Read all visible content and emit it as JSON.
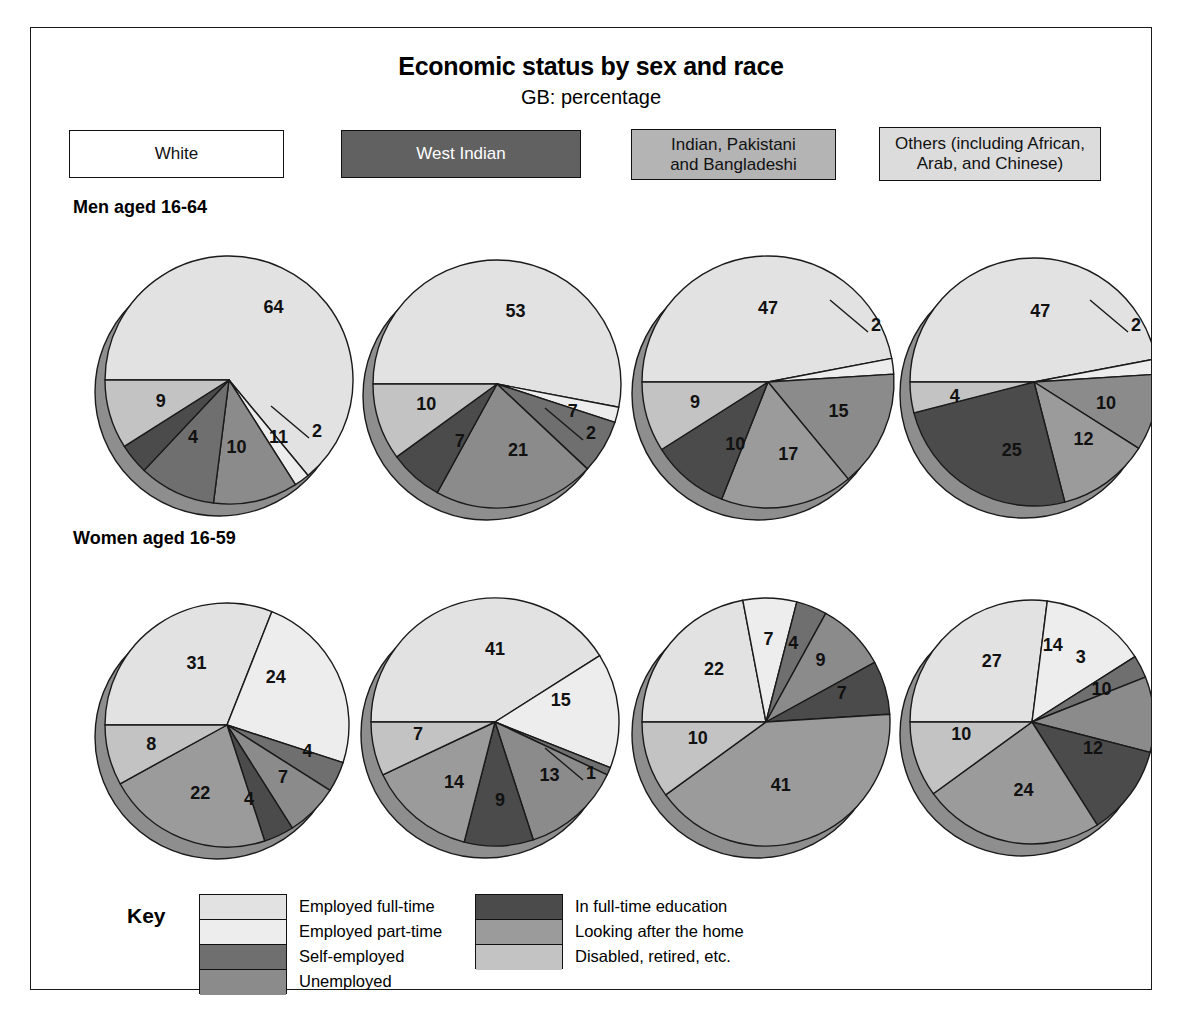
{
  "title": "Economic status by sex and race",
  "subtitle": "GB: percentage",
  "groups": [
    {
      "label": "White",
      "color": "#ffffff",
      "text": "#111111"
    },
    {
      "label": "West Indian",
      "color": "#616161",
      "text": "#ffffff"
    },
    {
      "label": "Indian, Pakistani\nand Bangladeshi",
      "color": "#b4b4b4",
      "text": "#111111"
    },
    {
      "label": "Others (including African,\nArab, and Chinese)",
      "color": "#dcdcdc",
      "text": "#111111"
    }
  ],
  "rows": [
    {
      "label": "Men aged 16-64"
    },
    {
      "label": "Women aged 16-59"
    }
  ],
  "key": {
    "word": "Key",
    "left": [
      {
        "label": "Employed full-time",
        "color": "#e2e2e2"
      },
      {
        "label": "Employed part-time",
        "color": "#ededed"
      },
      {
        "label": "Self-employed",
        "color": "#6f6f6f"
      },
      {
        "label": "Unemployed",
        "color": "#8b8b8b"
      }
    ],
    "right": [
      {
        "label": "In full-time education",
        "color": "#4b4b4b"
      },
      {
        "label": "Looking after the home",
        "color": "#9b9b9b"
      },
      {
        "label": "Disabled, retired, etc.",
        "color": "#c3c3c3"
      }
    ]
  },
  "chart_data": {
    "type": "pie",
    "title": "Economic status by sex and race",
    "subtitle": "GB: percentage",
    "unit": "percentage",
    "region": "GB",
    "categories": [
      "Employed full-time",
      "Employed part-time",
      "Self-employed",
      "Unemployed",
      "In full-time education",
      "Looking after the home",
      "Disabled, retired, etc."
    ],
    "category_colors": [
      "#e2e2e2",
      "#ededed",
      "#6f6f6f",
      "#8b8b8b",
      "#4b4b4b",
      "#9b9b9b",
      "#c3c3c3"
    ],
    "rows": [
      "Men aged 16-64",
      "Women aged 16-59"
    ],
    "columns": [
      "White",
      "West Indian",
      "Indian, Pakistani and Banyladeshi",
      "Others (including African, Arab, and Chinese)"
    ],
    "pies": [
      {
        "row": "Men aged 16-64",
        "column": "White",
        "cx": 198,
        "cy": 352,
        "r": 124,
        "start_angle": 180,
        "slices": [
          {
            "category": "Employed full-time",
            "value": 64,
            "color": "#e2e2e2",
            "label": "64",
            "lx": 0.36,
            "ly": -0.58
          },
          {
            "category": "Employed part-time",
            "value": 2,
            "color": "#ededed",
            "label": "2",
            "leader": true,
            "leader_dx": 76,
            "leader_dy": 52
          },
          {
            "category": "Unemployed",
            "value": 11,
            "color": "#8b8b8b",
            "label": "11",
            "lx": 0.4,
            "ly": 0.47
          },
          {
            "category": "Self-employed",
            "value": 10,
            "color": "#6f6f6f",
            "label": "10",
            "lx": 0.06,
            "ly": 0.55
          },
          {
            "category": "In full-time education",
            "value": 4,
            "color": "#4b4b4b",
            "label": "4",
            "lx": -0.29,
            "ly": 0.47
          },
          {
            "category": "Disabled, retired, etc.",
            "value": 9,
            "color": "#c3c3c3",
            "label": "9",
            "lx": -0.55,
            "ly": 0.18
          }
        ]
      },
      {
        "row": "Men aged 16-64",
        "column": "West Indian",
        "cx": 466,
        "cy": 356,
        "r": 124,
        "start_angle": 180,
        "slices": [
          {
            "category": "Employed full-time",
            "value": 53,
            "color": "#e2e2e2",
            "label": "53",
            "lx": 0.15,
            "ly": -0.58
          },
          {
            "category": "Employed part-time",
            "value": 2,
            "color": "#ededed",
            "label": "2",
            "leader": true,
            "leader_dx": 82,
            "leader_dy": 50
          },
          {
            "category": "Self-employed",
            "value": 7,
            "color": "#6f6f6f",
            "label": "7",
            "lx": 0.61,
            "ly": 0.23
          },
          {
            "category": "Unemployed",
            "value": 21,
            "color": "#8b8b8b",
            "label": "21",
            "lx": 0.17,
            "ly": 0.54
          },
          {
            "category": "In full-time education",
            "value": 7,
            "color": "#4b4b4b",
            "label": "7",
            "lx": -0.3,
            "ly": 0.47
          },
          {
            "category": "Disabled, retired, etc.",
            "value": 10,
            "color": "#c3c3c3",
            "label": "10",
            "lx": -0.57,
            "ly": 0.17
          }
        ]
      },
      {
        "row": "Men aged 16-64",
        "column": "Indian, Pakistani and Banyladeshi",
        "cx": 737,
        "cy": 354,
        "r": 126,
        "start_angle": 180,
        "slices": [
          {
            "category": "Employed full-time",
            "value": 47,
            "color": "#e2e2e2",
            "label": "47",
            "lx": 0.0,
            "ly": -0.58
          },
          {
            "category": "Employed part-time",
            "value": 2,
            "color": "#ededed",
            "label": "2",
            "leader": true,
            "leader_dx": 96,
            "leader_dy": -56
          },
          {
            "category": "Unemployed",
            "value": 15,
            "color": "#8b8b8b",
            "label": "15",
            "lx": 0.56,
            "ly": 0.24
          },
          {
            "category": "Looking after the home",
            "value": 17,
            "color": "#9b9b9b",
            "label": "17",
            "lx": 0.16,
            "ly": 0.58
          },
          {
            "category": "In full-time education",
            "value": 10,
            "color": "#4b4b4b",
            "label": "10",
            "lx": -0.26,
            "ly": 0.5
          },
          {
            "category": "Disabled, retired, etc.",
            "value": 9,
            "color": "#c3c3c3",
            "label": "9",
            "lx": -0.58,
            "ly": 0.17
          }
        ]
      },
      {
        "row": "Men aged 16-64",
        "column": "Others (including African, Arab, and Chinese)",
        "cx": 1003,
        "cy": 354,
        "r": 124,
        "start_angle": 180,
        "slices": [
          {
            "category": "Employed full-time",
            "value": 47,
            "color": "#e2e2e2",
            "label": "47",
            "lx": 0.05,
            "ly": -0.56
          },
          {
            "category": "Employed part-time",
            "value": 2,
            "color": "#ededed",
            "label": "2",
            "leader": true,
            "leader_dx": 90,
            "leader_dy": -56
          },
          {
            "category": "Unemployed",
            "value": 10,
            "color": "#8b8b8b",
            "label": "10",
            "lx": 0.58,
            "ly": 0.18
          },
          {
            "category": "Looking after the home",
            "value": 12,
            "color": "#9b9b9b",
            "label": "12",
            "lx": 0.4,
            "ly": 0.47
          },
          {
            "category": "In full-time education",
            "value": 25,
            "color": "#4b4b4b",
            "label": "25",
            "lx": -0.18,
            "ly": 0.56
          },
          {
            "category": "Disabled, retired, etc.",
            "value": 4,
            "color": "#c3c3c3",
            "label": "4",
            "lx": -0.64,
            "ly": 0.12
          }
        ]
      },
      {
        "row": "Women aged 16-59",
        "column": "White",
        "cx": 196,
        "cy": 697,
        "r": 122,
        "start_angle": 180,
        "slices": [
          {
            "category": "Employed full-time",
            "value": 31,
            "color": "#e2e2e2",
            "label": "31",
            "lx": -0.25,
            "ly": -0.5
          },
          {
            "category": "Employed part-time",
            "value": 24,
            "color": "#ededed",
            "label": "24",
            "lx": 0.4,
            "ly": -0.38
          },
          {
            "category": "Self-employed",
            "value": 4,
            "color": "#6f6f6f",
            "label": "4",
            "lx": 0.66,
            "ly": 0.22
          },
          {
            "category": "Unemployed",
            "value": 7,
            "color": "#8b8b8b",
            "label": "7",
            "lx": 0.46,
            "ly": 0.44
          },
          {
            "category": "In full-time education",
            "value": 4,
            "color": "#4b4b4b",
            "label": "4",
            "lx": 0.18,
            "ly": 0.62
          },
          {
            "category": "Looking after the home",
            "value": 22,
            "color": "#9b9b9b",
            "label": "22",
            "lx": -0.22,
            "ly": 0.57
          },
          {
            "category": "Disabled, retired, etc.",
            "value": 8,
            "color": "#c3c3c3",
            "label": "8",
            "lx": -0.62,
            "ly": 0.17
          }
        ]
      },
      {
        "row": "Women aged 16-59",
        "column": "West Indian",
        "cx": 464,
        "cy": 694,
        "r": 124,
        "start_angle": 180,
        "slices": [
          {
            "category": "Employed full-time",
            "value": 41,
            "color": "#e2e2e2",
            "label": "41",
            "lx": 0.0,
            "ly": -0.58
          },
          {
            "category": "Employed part-time",
            "value": 15,
            "color": "#ededed",
            "label": "15",
            "lx": 0.53,
            "ly": -0.17
          },
          {
            "category": "Self-employed",
            "value": 1,
            "color": "#6f6f6f",
            "label": "1",
            "leader": true,
            "leader_dx": 84,
            "leader_dy": 52
          },
          {
            "category": "Unemployed",
            "value": 13,
            "color": "#8b8b8b",
            "label": "13",
            "lx": 0.44,
            "ly": 0.44
          },
          {
            "category": "In full-time education",
            "value": 9,
            "color": "#4b4b4b",
            "label": "9",
            "lx": 0.04,
            "ly": 0.64
          },
          {
            "category": "Looking after the home",
            "value": 14,
            "color": "#9b9b9b",
            "label": "14",
            "lx": -0.33,
            "ly": 0.49
          },
          {
            "category": "Disabled, retired, etc.",
            "value": 7,
            "color": "#c3c3c3",
            "label": "7",
            "lx": -0.62,
            "ly": 0.11
          }
        ]
      },
      {
        "row": "Women aged 16-59",
        "column": "Indian, Pakistani and Banyladeshi",
        "cx": 735,
        "cy": 694,
        "r": 124,
        "start_angle": 180,
        "slices": [
          {
            "category": "Employed full-time",
            "value": 22,
            "color": "#e2e2e2",
            "label": "22",
            "lx": -0.42,
            "ly": -0.42
          },
          {
            "category": "Employed part-time",
            "value": 7,
            "color": "#ededed",
            "label": "7",
            "lx": 0.02,
            "ly": -0.66
          },
          {
            "category": "Self-employed",
            "value": 4,
            "color": "#6f6f6f",
            "label": "4",
            "lx": 0.22,
            "ly": -0.63
          },
          {
            "category": "Unemployed",
            "value": 9,
            "color": "#8b8b8b",
            "label": "9",
            "lx": 0.44,
            "ly": -0.49
          },
          {
            "category": "In full-time education",
            "value": 7,
            "color": "#4b4b4b",
            "label": "7",
            "lx": 0.61,
            "ly": -0.22
          },
          {
            "category": "Looking after the home",
            "value": 41,
            "color": "#9b9b9b",
            "label": "41",
            "lx": 0.12,
            "ly": 0.52
          },
          {
            "category": "Disabled, retired, etc.",
            "value": 10,
            "color": "#c3c3c3",
            "label": "10",
            "lx": -0.55,
            "ly": 0.14
          }
        ]
      },
      {
        "row": "Women aged 16-59",
        "column": "Others (including African, Arab, and Chinese)",
        "cx": 1001,
        "cy": 694,
        "r": 122,
        "start_angle": 180,
        "slices": [
          {
            "category": "Employed full-time",
            "value": 27,
            "color": "#e2e2e2",
            "label": "27",
            "lx": -0.33,
            "ly": -0.49
          },
          {
            "category": "Employed part-time",
            "value": 14,
            "color": "#ededed",
            "label": "14",
            "lx": 0.17,
            "ly": -0.62
          },
          {
            "category": "Self-employed",
            "value": 3,
            "color": "#6f6f6f",
            "label": "3",
            "lx": 0.4,
            "ly": -0.52
          },
          {
            "category": "Unemployed",
            "value": 10,
            "color": "#8b8b8b",
            "label": "10",
            "lx": 0.57,
            "ly": -0.26
          },
          {
            "category": "In full-time education",
            "value": 12,
            "color": "#4b4b4b",
            "label": "12",
            "lx": 0.5,
            "ly": 0.22
          },
          {
            "category": "Looking after the home",
            "value": 24,
            "color": "#9b9b9b",
            "label": "24",
            "lx": -0.07,
            "ly": 0.57
          },
          {
            "category": "Disabled, retired, etc.",
            "value": 10,
            "color": "#c3c3c3",
            "label": "10",
            "lx": -0.58,
            "ly": 0.11
          }
        ]
      }
    ]
  }
}
